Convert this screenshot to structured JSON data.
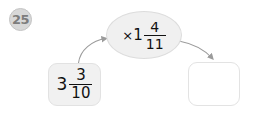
{
  "problem": {
    "number": "25"
  },
  "machine": {
    "input": {
      "whole": "3",
      "numerator": "3",
      "denominator": "10",
      "full_text": "3 3/10"
    },
    "operation": {
      "symbol": "×",
      "whole": "1",
      "numerator": "4",
      "denominator": "11",
      "full_text": "×1 4/11"
    },
    "output": {
      "value": "",
      "placeholder": ""
    }
  },
  "colors": {
    "page_background": "#ffffff",
    "badge_fill": "#d8d8d8",
    "badge_text": "#7d7d7d",
    "input_box_fill": "#f1f1f1",
    "input_box_border": "#e2e2e2",
    "oval_fill": "#f0f0f0",
    "oval_border": "#dcdcdc",
    "output_box_fill": "#ffffff",
    "output_box_border": "#e3e3e3",
    "text": "#111111",
    "arrow": "#9b9b9b"
  },
  "icons": {
    "arrow_in": "curved-arrow-up-right-icon",
    "arrow_out": "curved-arrow-down-right-icon"
  }
}
